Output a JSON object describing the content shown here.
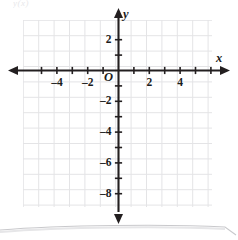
{
  "figure": {
    "kind": "coordinate-plane",
    "scan_artifact_text": "y(x)",
    "background_color": "#ffffff",
    "grid_color": "#e4e4e6",
    "axis_color": "#231f20"
  },
  "axes": {
    "x_axis_name": "x",
    "y_axis_name": "y",
    "origin_label": "O"
  },
  "chart_data": {
    "type": "scatter",
    "title": "",
    "xlabel": "x",
    "ylabel": "y",
    "xlim": [
      -6,
      6
    ],
    "ylim": [
      -9,
      3
    ],
    "grid": true,
    "legend": null,
    "x_ticks": [
      -5,
      -4,
      -3,
      -2,
      -1,
      0,
      1,
      2,
      3,
      4,
      5,
      6
    ],
    "x_tick_labels": [
      "",
      "-4",
      "",
      "-2",
      "",
      "O",
      "",
      "2",
      "",
      "4",
      "",
      ""
    ],
    "y_ticks": [
      2,
      1,
      0,
      -1,
      -2,
      -3,
      -4,
      -5,
      -6,
      -7,
      -8
    ],
    "y_tick_labels": [
      "2",
      "",
      "",
      "",
      "-2",
      "",
      "-4",
      "",
      "-6",
      "",
      "-8"
    ],
    "x_labeled_ticks": [
      {
        "value": -4,
        "label": "-4"
      },
      {
        "value": -2,
        "label": "-2"
      },
      {
        "value": 2,
        "label": "2"
      },
      {
        "value": 4,
        "label": "4"
      }
    ],
    "y_labeled_ticks": [
      {
        "value": 2,
        "label": "2"
      },
      {
        "value": -2,
        "label": "-2"
      },
      {
        "value": -4,
        "label": "-4"
      },
      {
        "value": -6,
        "label": "-6"
      },
      {
        "value": -8,
        "label": "-8"
      }
    ],
    "series": [],
    "values": [],
    "categories": [],
    "annotations": []
  }
}
